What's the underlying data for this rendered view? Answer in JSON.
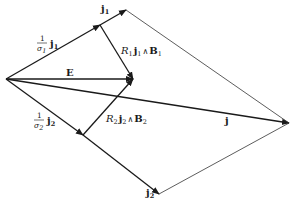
{
  "diagram": {
    "type": "vector-diagram",
    "points": {
      "origin": [
        6,
        79
      ],
      "j1_tip": [
        126,
        10
      ],
      "j1_sigma_tip": [
        100,
        25
      ],
      "E_tip": [
        133,
        79
      ],
      "j_tip": [
        289,
        123
      ],
      "j2_sigma_tip": [
        83,
        135
      ],
      "j2_tip": [
        159,
        194
      ]
    },
    "labels": {
      "j1": "j",
      "j1_sub": "1",
      "j1_scaled_num": "1",
      "j1_scaled_den": "σ",
      "j1_scaled_den_sub": "1",
      "j1_scaled_vec": "j",
      "j1_scaled_vec_sub": "1",
      "hall1_R": "R",
      "hall1_R_sub": "1",
      "hall1_j": "j",
      "hall1_j_sub": "1",
      "hall1_wedge": "∧",
      "hall1_B": "B",
      "hall1_B_sub": "1",
      "E": "E",
      "j2": "j",
      "j2_sub": "2",
      "j2_scaled_num": "1",
      "j2_scaled_den": "σ",
      "j2_scaled_den_sub": "2",
      "j2_scaled_vec": "j",
      "j2_scaled_vec_sub": "2",
      "hall2_R": "R",
      "hall2_R_sub": "2",
      "hall2_j": "j",
      "hall2_j_sub": "2",
      "hall2_wedge": "∧",
      "hall2_B": "B",
      "hall2_B_sub": "2",
      "j": "j"
    }
  }
}
